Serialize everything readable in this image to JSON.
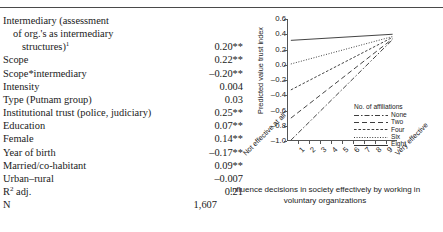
{
  "table": {
    "rows": [
      {
        "label": "Intermediary (assessment",
        "indent": 0,
        "value": ""
      },
      {
        "label": "of org.'s as intermediary",
        "indent": 1,
        "value": ""
      },
      {
        "label": "structures)",
        "indent": 2,
        "sup": "1",
        "value": "0.20**"
      },
      {
        "label": "Scope",
        "indent": 0,
        "value": "0.22**"
      },
      {
        "label": "Scope*intermediary",
        "indent": 0,
        "value": "–0.20**"
      },
      {
        "label": "Intensity",
        "indent": 0,
        "value": "0.004"
      },
      {
        "label": "Type (Putnam group)",
        "indent": 0,
        "value": "0.03"
      },
      {
        "label": "Institutional trust (police, judiciary)",
        "indent": 0,
        "value": "0.25**"
      },
      {
        "label": "Education",
        "indent": 0,
        "value": "0.07**"
      },
      {
        "label": "Female",
        "indent": 0,
        "value": "0.14**"
      },
      {
        "label": "Year of birth",
        "indent": 0,
        "value": "–0.17**"
      },
      {
        "label": "Married/co-habitant",
        "indent": 0,
        "value": "0.09**"
      },
      {
        "label": "Urban–rural",
        "indent": 0,
        "value": "–0.007"
      },
      {
        "label": "R",
        "indent": 0,
        "sup": "2",
        "label_tail": " adj.",
        "value": "0.21"
      },
      {
        "label": "N",
        "indent": 0,
        "value": "1,607",
        "value_wide": true
      }
    ]
  },
  "chart_data": {
    "type": "line",
    "title": "",
    "xlabel": "Influence decisions in society effectively by working in voluntary organizations",
    "ylabel": "Predicted value trust index",
    "ylim": [
      -1.0,
      0.6
    ],
    "yticks": [
      0.6,
      0.4,
      0.2,
      0.0,
      -0.2,
      -0.4,
      -0.6,
      -0.8,
      -1.0
    ],
    "ytick_labels": [
      "0.6",
      "0.4",
      "0.2",
      "0.0",
      "–0.2",
      "–0.4",
      "–0.6",
      "–0.8",
      "–1.0"
    ],
    "xlim": [
      0,
      10
    ],
    "x": [
      1,
      2,
      3,
      4,
      5,
      6,
      7,
      8,
      9
    ],
    "xtick_labels": [
      "1",
      "2",
      "3",
      "4",
      "5",
      "6",
      "7",
      "8",
      "9"
    ],
    "x_axis_low_label": "Not effective at all",
    "x_axis_high_label": "Very effective",
    "grid": false,
    "legend_title": "No. of affiliations",
    "legend_position": "bottom-right",
    "series": [
      {
        "name": "None",
        "dash": "5,2,1.5,2",
        "x0": 0.35,
        "y0": -0.99,
        "x1": 9.6,
        "y1": 0.33,
        "values": [
          -0.85,
          -0.7,
          -0.56,
          -0.41,
          -0.27,
          -0.12,
          0.02,
          0.17,
          0.31
        ]
      },
      {
        "name": "Two",
        "dash": "5,3",
        "x0": 0.35,
        "y0": -0.7,
        "x1": 9.6,
        "y1": 0.34,
        "values": [
          -0.59,
          -0.48,
          -0.36,
          -0.24,
          -0.13,
          -0.01,
          0.1,
          0.22,
          0.33
        ]
      },
      {
        "name": "Four",
        "dash": "2.6,1.8",
        "x0": 0.35,
        "y0": -0.33,
        "x1": 9.6,
        "y1": 0.36,
        "values": [
          -0.26,
          -0.18,
          -0.11,
          -0.03,
          0.04,
          0.12,
          0.19,
          0.27,
          0.34
        ]
      },
      {
        "name": "Six",
        "dash": "1,1.6",
        "x0": 0.35,
        "y0": 0.01,
        "x1": 9.6,
        "y1": 0.37,
        "values": [
          0.05,
          0.09,
          0.13,
          0.17,
          0.21,
          0.25,
          0.29,
          0.33,
          0.37
        ]
      },
      {
        "name": "Eight",
        "dash": "0",
        "x0": 0.35,
        "y0": 0.32,
        "x1": 9.6,
        "y1": 0.4,
        "values": [
          0.33,
          0.34,
          0.35,
          0.35,
          0.36,
          0.37,
          0.38,
          0.38,
          0.39
        ]
      }
    ]
  }
}
